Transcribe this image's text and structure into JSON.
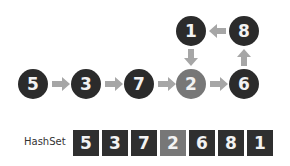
{
  "diagram": {
    "nodes": [
      {
        "id": "5",
        "label": "5",
        "x": 33,
        "y": 84,
        "highlight": false
      },
      {
        "id": "3",
        "label": "3",
        "x": 86,
        "y": 84,
        "highlight": false
      },
      {
        "id": "7",
        "label": "7",
        "x": 139,
        "y": 84,
        "highlight": false
      },
      {
        "id": "2",
        "label": "2",
        "x": 191,
        "y": 84,
        "highlight": true
      },
      {
        "id": "6",
        "label": "6",
        "x": 244,
        "y": 84,
        "highlight": false
      },
      {
        "id": "8",
        "label": "8",
        "x": 244,
        "y": 31,
        "highlight": false
      },
      {
        "id": "1",
        "label": "1",
        "x": 191,
        "y": 31,
        "highlight": false
      }
    ],
    "edges": [
      {
        "from": "5",
        "to": "3"
      },
      {
        "from": "3",
        "to": "7"
      },
      {
        "from": "7",
        "to": "2"
      },
      {
        "from": "2",
        "to": "6"
      },
      {
        "from": "6",
        "to": "8"
      },
      {
        "from": "8",
        "to": "1"
      },
      {
        "from": "1",
        "to": "2"
      }
    ],
    "colors": {
      "node": "#2b2b2b",
      "highlight": "#777777",
      "arrow": "#a6a6a6",
      "text": "#f2f2f2"
    }
  },
  "hashset": {
    "label": "HashSet",
    "values": [
      "5",
      "3",
      "7",
      "2",
      "6",
      "8",
      "1"
    ],
    "highlight_index": 3
  }
}
